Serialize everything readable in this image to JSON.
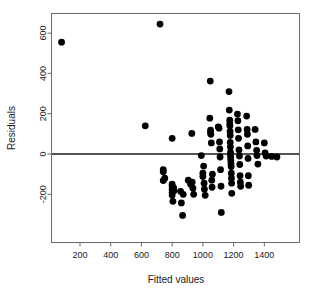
{
  "chart_data": {
    "type": "scatter",
    "title": "",
    "xlabel": "Fitted values",
    "ylabel": "Residuals",
    "xlim": [
      30,
      1530
    ],
    "ylim": [
      -330,
      680
    ],
    "grid": false,
    "legend": null,
    "xticks": [
      200,
      400,
      600,
      800,
      1000,
      1200,
      1400
    ],
    "xtick_labels": [
      "200",
      "400",
      "600",
      "800",
      "1000",
      "1200",
      "1400"
    ],
    "yticks": [
      -200,
      0,
      200,
      400,
      600
    ],
    "ytick_labels": [
      "-200",
      "0",
      "200",
      "400",
      "600"
    ],
    "reference_line": {
      "type": "horizontal",
      "y": 0,
      "color": "#1a1a1a",
      "label": "zero residual line"
    },
    "marker": {
      "shape": "circle",
      "color": "#000000",
      "size": 3.4
    },
    "series": [
      {
        "name": "Residuals vs Fitted",
        "points": [
          [
            80,
            555
          ],
          [
            721,
            645
          ],
          [
            625,
            140
          ],
          [
            742,
            -88
          ],
          [
            742,
            -78
          ],
          [
            742,
            -132
          ],
          [
            752,
            -120
          ],
          [
            800,
            78
          ],
          [
            800,
            -160
          ],
          [
            800,
            -175
          ],
          [
            800,
            -190
          ],
          [
            800,
            -205
          ],
          [
            800,
            -150
          ],
          [
            805,
            -235
          ],
          [
            810,
            -168
          ],
          [
            812,
            -182
          ],
          [
            855,
            -185
          ],
          [
            860,
            -243
          ],
          [
            868,
            -305
          ],
          [
            872,
            -200
          ],
          [
            905,
            -130
          ],
          [
            920,
            -150
          ],
          [
            928,
            102
          ],
          [
            930,
            -140
          ],
          [
            935,
            -170
          ],
          [
            940,
            -200
          ],
          [
            990,
            -8
          ],
          [
            1000,
            -95
          ],
          [
            1000,
            -112
          ],
          [
            1005,
            -60
          ],
          [
            1008,
            -145
          ],
          [
            1010,
            -175
          ],
          [
            1015,
            -205
          ],
          [
            1045,
            178
          ],
          [
            1048,
            362
          ],
          [
            1050,
            118
          ],
          [
            1050,
            105
          ],
          [
            1052,
            98
          ],
          [
            1055,
            55
          ],
          [
            1058,
            -130
          ],
          [
            1060,
            -165
          ],
          [
            1062,
            -100
          ],
          [
            1100,
            135
          ],
          [
            1105,
            128
          ],
          [
            1108,
            60
          ],
          [
            1110,
            25
          ],
          [
            1112,
            -15
          ],
          [
            1115,
            -78
          ],
          [
            1118,
            -160
          ],
          [
            1120,
            -290
          ],
          [
            1170,
            310
          ],
          [
            1172,
            218
          ],
          [
            1175,
            168
          ],
          [
            1175,
            150
          ],
          [
            1176,
            140
          ],
          [
            1177,
            112
          ],
          [
            1178,
            92
          ],
          [
            1178,
            58
          ],
          [
            1179,
            35
          ],
          [
            1180,
            8
          ],
          [
            1180,
            -5
          ],
          [
            1181,
            -18
          ],
          [
            1182,
            -32
          ],
          [
            1183,
            -48
          ],
          [
            1184,
            -62
          ],
          [
            1185,
            -95
          ],
          [
            1186,
            -120
          ],
          [
            1187,
            -145
          ],
          [
            1188,
            -195
          ],
          [
            1225,
            198
          ],
          [
            1228,
            165
          ],
          [
            1230,
            120
          ],
          [
            1232,
            78
          ],
          [
            1235,
            20
          ],
          [
            1238,
            -10
          ],
          [
            1240,
            -52
          ],
          [
            1242,
            -108
          ],
          [
            1244,
            -140
          ],
          [
            1246,
            -160
          ],
          [
            1285,
            188
          ],
          [
            1288,
            122
          ],
          [
            1290,
            98
          ],
          [
            1292,
            40
          ],
          [
            1294,
            -22
          ],
          [
            1296,
            -108
          ],
          [
            1298,
            -155
          ],
          [
            1340,
            122
          ],
          [
            1345,
            60
          ],
          [
            1350,
            18
          ],
          [
            1352,
            -8
          ],
          [
            1358,
            -50
          ],
          [
            1400,
            55
          ],
          [
            1405,
            5
          ],
          [
            1412,
            -10
          ],
          [
            1448,
            -12
          ],
          [
            1482,
            -15
          ]
        ]
      }
    ]
  },
  "axes": {
    "y_label_text": "Residuals",
    "x_label_text": "Fitted values"
  }
}
